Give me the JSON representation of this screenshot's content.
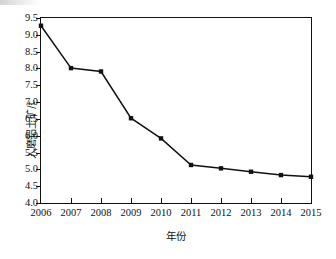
{
  "chart_data": {
    "type": "line",
    "title": "",
    "xlabel": "年份",
    "ylabel": "入磨铝土矿/t",
    "categories": [
      "2006",
      "2007",
      "2008",
      "2009",
      "2010",
      "2011",
      "2012",
      "2013",
      "2014",
      "2015"
    ],
    "values": [
      9.27,
      8.01,
      7.91,
      6.52,
      5.92,
      5.13,
      5.03,
      4.93,
      4.83,
      4.78
    ],
    "series": [
      {
        "name": "入磨铝土矿",
        "values": [
          9.27,
          8.01,
          7.91,
          6.52,
          5.92,
          5.13,
          5.03,
          4.93,
          4.83,
          4.78
        ]
      }
    ],
    "ylim": [
      4.0,
      9.5
    ],
    "ytick_labels": [
      "4.0",
      "4.5",
      "5.0",
      "5.5",
      "6.0",
      "6.5",
      "7.0",
      "7.5",
      "8.0",
      "8.5",
      "9.0",
      "9.5"
    ],
    "ytick_values": [
      4.0,
      4.5,
      5.0,
      5.5,
      6.0,
      6.5,
      7.0,
      7.5,
      8.0,
      8.5,
      9.0,
      9.5
    ],
    "xtick_labels": [
      "2006",
      "2007",
      "2008",
      "2009",
      "2010",
      "2011",
      "2012",
      "2013",
      "2014",
      "2015"
    ],
    "grid": false,
    "legend": "none",
    "marker": "square",
    "line_color": "#111111",
    "marker_color": "#111111",
    "frame_color": "#111111",
    "background": "#ffffff"
  }
}
